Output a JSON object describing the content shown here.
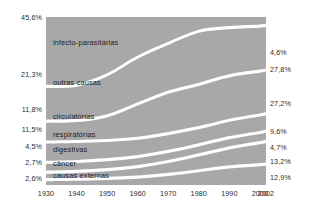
{
  "chart_data": {
    "type": "area",
    "title": "",
    "subtitle": "",
    "xlabel": "",
    "ylabel": "",
    "stacked": true,
    "normalized": true,
    "grid": false,
    "legend_position": "inline-band-labels",
    "axis_color": "#2b2b2b",
    "band_fill": "#a8a8a8",
    "background": "#ffffff",
    "x": [
      1930,
      1940,
      1950,
      1960,
      1970,
      1980,
      1990,
      2000,
      2002
    ],
    "xtick_labels": [
      "1930",
      "1940",
      "1950",
      "1960",
      "1970",
      "1980",
      "1990",
      "2000",
      "2002"
    ],
    "ylim": [
      0,
      100
    ],
    "value_suffix": "%",
    "series": [
      {
        "name": "infecto-parasitárias",
        "label": "infecto-parasitárias",
        "start_value": "45,6%",
        "end_value": "4,6%",
        "values": [
          45.6,
          44.8,
          38.0,
          26.0,
          16.5,
          8.5,
          6.0,
          5.0,
          4.6
        ]
      },
      {
        "name": "outras causas",
        "label": "outras causas",
        "start_value": "21,3%",
        "end_value": "27,8%",
        "values": [
          21.3,
          21.5,
          25.5,
          29.5,
          30.5,
          33.5,
          30.0,
          28.2,
          27.8
        ]
      },
      {
        "name": "circulatórias",
        "label": "circulatórias",
        "start_value": "11,8%",
        "end_value": "27,2%",
        "values": [
          11.8,
          12.0,
          14.5,
          21.0,
          25.5,
          27.0,
          27.5,
          27.3,
          27.2
        ]
      },
      {
        "name": "respiratórias",
        "label": "respiratórias",
        "start_value": "11,5%",
        "end_value": "9,6%",
        "values": [
          11.5,
          11.3,
          10.8,
          10.2,
          9.8,
          9.4,
          9.5,
          9.6,
          9.6
        ]
      },
      {
        "name": "digestivas",
        "label": "digestivas",
        "start_value": "4,5%",
        "end_value": "4,7%",
        "values": [
          4.5,
          4.5,
          4.5,
          4.6,
          4.6,
          4.6,
          4.7,
          4.7,
          4.7
        ]
      },
      {
        "name": "câncer",
        "label": "câncer",
        "start_value": "2,7%",
        "end_value": "13,2%",
        "values": [
          2.7,
          3.0,
          3.8,
          5.0,
          6.5,
          8.5,
          10.5,
          12.6,
          13.2
        ]
      },
      {
        "name": "causas externas",
        "label": "causas externas",
        "start_value": "2,6%",
        "end_value": "12,9%",
        "values": [
          2.6,
          2.9,
          3.4,
          4.2,
          6.0,
          8.5,
          11.0,
          12.6,
          12.9
        ]
      }
    ],
    "left_axis_labels": [
      "45,6%",
      "21,3%",
      "11,8%",
      "11,5%",
      "4,5%",
      "2,7%",
      "2,6%"
    ],
    "right_axis_labels": [
      "4,6%",
      "27,8%",
      "27,2%",
      "9,6%",
      "4,7%",
      "13,2%",
      "12,9%"
    ]
  }
}
